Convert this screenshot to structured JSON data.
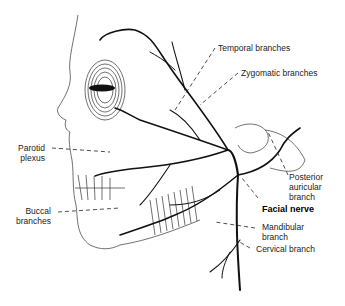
{
  "figure": {
    "labels": {
      "temporal": "Temporal branches",
      "zygomatic": "Zygomatic branches",
      "parotid": "Parotid\nplexus",
      "buccal": "Buccal\nbranches",
      "posterior_auricular": "Posterior\nauricular\nbranch",
      "facial_nerve": "Facial nerve",
      "mandibular": "Mandibular\nbranch",
      "cervical": "Cervical branch"
    },
    "colors": {
      "line": "#111111",
      "background": "#ffffff",
      "text": "#222222"
    }
  }
}
